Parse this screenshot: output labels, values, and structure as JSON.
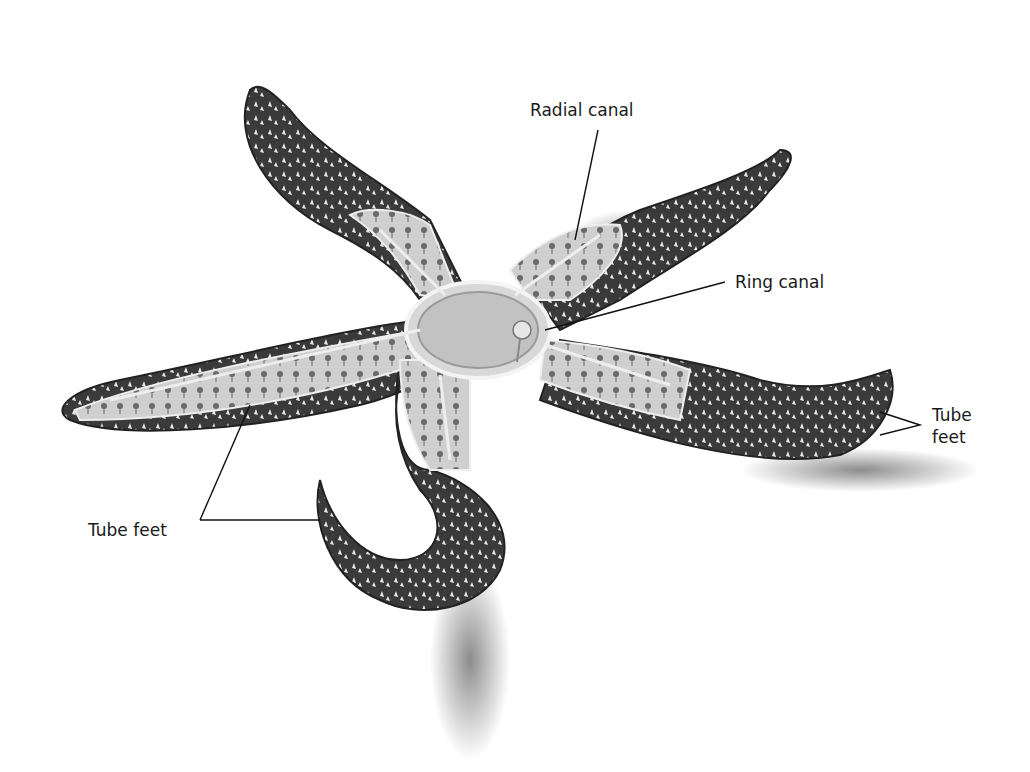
{
  "diagram": {
    "background_color": "#ffffff",
    "body_color": "#3a3a3a",
    "cutaway_color": "#d4d4d4",
    "labels": [
      {
        "id": "radial-canal",
        "text": "Radial canal",
        "x": 530,
        "y": 100
      },
      {
        "id": "ring-canal",
        "text": "Ring canal",
        "x": 735,
        "y": 272
      },
      {
        "id": "tube-feet-right",
        "text": "Tube\nfeet",
        "x": 932,
        "y": 404
      },
      {
        "id": "tube-feet-left",
        "text": "Tube feet",
        "x": 88,
        "y": 520
      }
    ]
  }
}
